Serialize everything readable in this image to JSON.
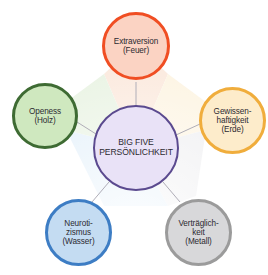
{
  "diagram": {
    "title": "BIG FIVE PERSÖNLICHKEIT",
    "center": {
      "name": "big-five-hub",
      "label": "BIG FIVE\nPERSÖNLICHKEIT",
      "border_color": "#5b4a8f",
      "fill_color": "#e9e2f7"
    },
    "nodes": [
      {
        "key": "extraversion",
        "label": "Extraversion\n(Feuer)",
        "trait": "Extraversion",
        "element": "Feuer",
        "position": "top",
        "border_color": "#f04e23",
        "fill_color": "#fbd3c3",
        "wedge_color": "#fbe9dd"
      },
      {
        "key": "gewissenhaftigkeit",
        "label": "Gewissen-\nhaftigkeit\n(Erde)",
        "trait": "Gewissenhaftigkeit",
        "element": "Erde",
        "position": "right",
        "border_color": "#f0ad3c",
        "fill_color": "#fdeccb",
        "wedge_color": "#fdf4e2"
      },
      {
        "key": "vertraeglichkeit",
        "label": "Verträglich-\nkeit\n(Metall)",
        "trait": "Verträglichkeit",
        "element": "Metall",
        "position": "bottom-right",
        "border_color": "#9b9b9b",
        "fill_color": "#d8d8da",
        "wedge_color": "#eeeef0"
      },
      {
        "key": "neurotizismus",
        "label": "Neuroti-\nzismus\n(Wasser)",
        "trait": "Neurotizismus",
        "element": "Wasser",
        "position": "bottom-left",
        "border_color": "#3d7dc4",
        "fill_color": "#c4dcf2",
        "wedge_color": "#e1effa"
      },
      {
        "key": "openess",
        "label": "Openess\n(Holz)",
        "trait": "Openess",
        "element": "Holz",
        "position": "left",
        "border_color": "#3e6b33",
        "fill_color": "#cfe8bf",
        "wedge_color": "#e8f2e2"
      }
    ],
    "connector_color": "#b0aeb8"
  }
}
